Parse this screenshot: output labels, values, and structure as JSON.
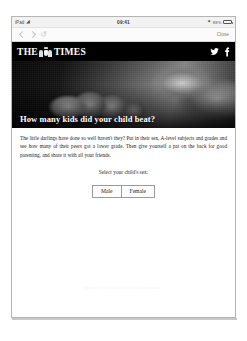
{
  "status_bar": {
    "carrier": "iPad",
    "wifi_icon": "wifi-icon",
    "time": "09:41",
    "bluetooth_icon": "bluetooth-icon",
    "battery_percent": "88%",
    "battery_icon": "battery-icon"
  },
  "toolbar": {
    "back_icon": "chevron-left-icon",
    "forward_icon": "chevron-right-icon",
    "reload_icon": "reload-icon",
    "close_label": "Close"
  },
  "masthead": {
    "word_the": "THE",
    "crest_icon": "royal-crest-icon",
    "word_times": "TIMES",
    "twitter_icon": "twitter-icon",
    "facebook_icon": "facebook-icon"
  },
  "hero": {
    "headline": "How many kids did your child beat?",
    "photo_alt": "students-celebrating-photo"
  },
  "article": {
    "body": "The little darlings have done so well haven't they? Put in their sex, A-level subjects and grades and see how many of their peers got a lower grade. Then give yourself a pat on the back for good parenting, and share it with all your friends."
  },
  "form": {
    "prompt": "Select your child's sex:",
    "options": [
      {
        "label": "Male"
      },
      {
        "label": "Female"
      }
    ]
  },
  "footer": {
    "note": "Source: Joint Council for Qualifications"
  },
  "colors": {
    "masthead_background": "#000000",
    "page_background": "#ffffff",
    "text": "#232323",
    "toolbar_background": "#fbfbfb"
  }
}
